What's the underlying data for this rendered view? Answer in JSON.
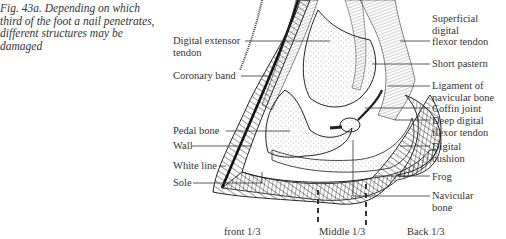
{
  "caption": "Fig. 43a. Depending on which third of the foot a nail penetrates, different structures may be damaged",
  "labels_left": {
    "digital_extensor_tendon_line1": "Digital extensor",
    "digital_extensor_tendon_line2": "tendon",
    "coronary_band": "Coronary band",
    "pedal_bone": "Pedal bone",
    "wall": "Wall",
    "white_line": "White line",
    "sole": "Sole"
  },
  "labels_right": {
    "superficial_digital_flexor_tendon_line1": "Superficial",
    "superficial_digital_flexor_tendon_line2": "digital",
    "superficial_digital_flexor_tendon_line3": "flexor tendon",
    "short_pastern": "Short pastern",
    "ligament_navicular_line1": "Ligament of",
    "ligament_navicular_line2": "navicular bone",
    "coffin_joint": "Coffin joint",
    "deep_digital_flexor_line1": "Deep digital",
    "deep_digital_flexor_line2": "flexor tendon",
    "digital_cushion_line1": "Digital",
    "digital_cushion_line2": "cushion",
    "frog": "Frog",
    "navicular_bone_line1": "Navicular",
    "navicular_bone_line2": "bone"
  },
  "zones": {
    "front": "front 1/3",
    "middle": "Middle 1/3",
    "back": "Back 1/3"
  }
}
